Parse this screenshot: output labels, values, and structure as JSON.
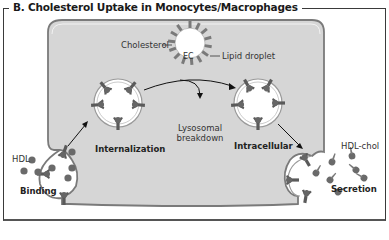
{
  "title": "B. Cholesterol Uptake in Monocytes/Macrophages",
  "labels": {
    "cholesterol": "Cholesterol",
    "ec": "EC",
    "lipid_droplet": "Lipid droplet",
    "hdl": "HDL",
    "binding": "Binding",
    "internalization": "Internalization",
    "lysosomal_line1": "Lysosomal",
    "lysosomal_line2": "breakdown",
    "intracellular": "Intracellular",
    "hdl_chol": "HDL-chol",
    "secretion": "Secretion"
  },
  "colors": {
    "cell_fill": "#d6d6d6",
    "membrane": "#7a7a7a",
    "receptor": "#5a5a5a",
    "vesicle_fill": "#ffffff",
    "text": "#222222"
  }
}
